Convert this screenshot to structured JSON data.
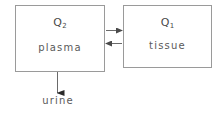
{
  "diagram": {
    "type": "two-compartment-model",
    "background_color": "#ffffff",
    "line_color": "#6a6a6a",
    "box_border_color": "#9a9a9a",
    "text_color": "#5a5a5a",
    "compartments": [
      {
        "id": "plasma",
        "quantity_symbol": "Q",
        "quantity_subscript": "2",
        "name": "plasma",
        "position": {
          "x": 15,
          "y": 5,
          "width": 90,
          "height": 67
        }
      },
      {
        "id": "tissue",
        "quantity_symbol": "Q",
        "quantity_subscript": "1",
        "name": "tissue",
        "position": {
          "x": 123,
          "y": 5,
          "width": 89,
          "height": 63
        }
      }
    ],
    "flows": [
      {
        "id": "plasma-to-tissue",
        "direction": "right",
        "from": "plasma",
        "to": "tissue",
        "label": ""
      },
      {
        "id": "tissue-to-plasma",
        "direction": "left",
        "from": "tissue",
        "to": "plasma",
        "label": ""
      },
      {
        "id": "plasma-to-urine",
        "direction": "down",
        "from": "plasma",
        "to": "urine",
        "label": ""
      }
    ],
    "sink": {
      "id": "urine",
      "label": "urine"
    }
  }
}
